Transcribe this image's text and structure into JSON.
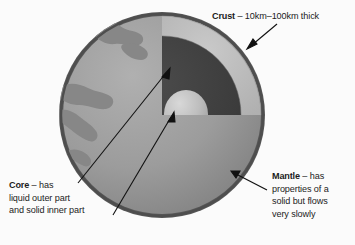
{
  "diagram": {
    "background_color": "#fbfbfb",
    "labels": {
      "crust": {
        "term": "Crust",
        "dash": "–",
        "description": "10km–100km thick"
      },
      "core": {
        "term": "Core",
        "dash": "–",
        "line1": "has",
        "line2": "liquid outer part",
        "line3": "and solid inner part"
      },
      "mantle": {
        "term": "Mantle",
        "dash": "–",
        "line1": "has",
        "line2": "properties of a",
        "line3": "solid but flows",
        "line4": "very slowly"
      }
    },
    "layers": [
      {
        "name": "crust",
        "color": "#585858"
      },
      {
        "name": "mantle",
        "color": "#b9b9b9"
      },
      {
        "name": "outer-core",
        "color": "#3a3a3a"
      },
      {
        "name": "inner-core",
        "color": "#bdbdbd"
      },
      {
        "name": "surface",
        "color": "#9a9a9a"
      },
      {
        "name": "continents",
        "color": "#8a8a8a"
      }
    ],
    "arrows": [
      {
        "name": "crust-arrow",
        "points_to": "crust"
      },
      {
        "name": "core-outer-arrow",
        "points_to": "outer-core"
      },
      {
        "name": "core-inner-arrow",
        "points_to": "inner-core"
      },
      {
        "name": "mantle-arrow",
        "points_to": "mantle"
      }
    ]
  }
}
